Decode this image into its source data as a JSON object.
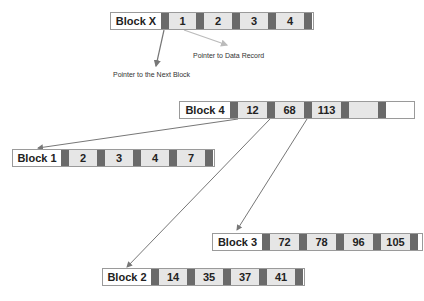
{
  "colors": {
    "pointer_cell": "#6a6a6a",
    "key_cell": "#e6e6e6",
    "arrow_dark": "#777777",
    "arrow_light": "#bbbbbb"
  },
  "legend": {
    "block_label": "Block X",
    "keys": [
      "1",
      "2",
      "3",
      "4"
    ],
    "next_block_pointer_caption": "Pointer to the Next Block",
    "data_record_pointer_caption": "Pointer to Data Record"
  },
  "blocks": [
    {
      "label": "Block 4",
      "keys": [
        "12",
        "68",
        "113",
        ""
      ]
    },
    {
      "label": "Block 1",
      "keys": [
        "2",
        "3",
        "4",
        "7"
      ]
    },
    {
      "label": "Block 3",
      "keys": [
        "72",
        "78",
        "96",
        "105"
      ]
    },
    {
      "label": "Block 2",
      "keys": [
        "14",
        "35",
        "37",
        "41"
      ]
    }
  ],
  "edges": [
    {
      "from": "Block 4",
      "to": "Block 1"
    },
    {
      "from": "Block 4",
      "to": "Block 2"
    },
    {
      "from": "Block 4",
      "to": "Block 3"
    }
  ]
}
